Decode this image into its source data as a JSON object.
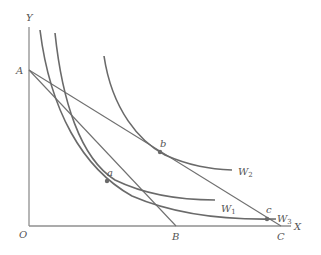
{
  "diagram": {
    "type": "indifference-curves-budget-lines",
    "axes": {
      "x_label": "X",
      "y_label": "Y",
      "origin_label": "O"
    },
    "intercepts": {
      "A": {
        "label": "A",
        "axis": "Y"
      },
      "B": {
        "label": "B",
        "axis": "X"
      },
      "C": {
        "label": "C",
        "axis": "X"
      }
    },
    "budget_lines": [
      {
        "name": "AB",
        "from": "A",
        "to": "B"
      },
      {
        "name": "AC",
        "from": "A",
        "to": "C"
      }
    ],
    "indifference_curves": [
      {
        "name": "W1",
        "base": "W",
        "sub": "1"
      },
      {
        "name": "W2",
        "base": "W",
        "sub": "2"
      },
      {
        "name": "W3",
        "base": "W",
        "sub": "3"
      }
    ],
    "points": [
      {
        "label": "a",
        "on_curve": "W1",
        "on_line": "AB"
      },
      {
        "label": "b",
        "on_curve": "W2",
        "on_line": "AC"
      },
      {
        "label": "c",
        "on_curve": "W3",
        "on_line": "AC"
      }
    ],
    "colors": {
      "curve": "#6a6a6a",
      "axis": "#8f8f8f",
      "label": "#555555",
      "background": "#ffffff"
    }
  }
}
